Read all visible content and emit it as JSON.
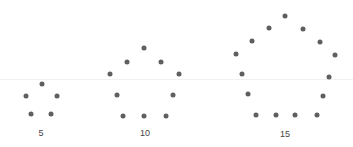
{
  "figure": {
    "title": "",
    "dot_color": "#5f5f5f",
    "groups": [
      {
        "label": "5",
        "count": 5,
        "label_pos": [
          41,
          133
        ],
        "dots": [
          [
            42,
            84
          ],
          [
            26,
            96
          ],
          [
            57,
            96
          ],
          [
            31,
            114
          ],
          [
            51,
            114
          ]
        ]
      },
      {
        "label": "10",
        "count": 10,
        "label_pos": [
          145,
          133
        ],
        "dots": [
          [
            144,
            48
          ],
          [
            127,
            62
          ],
          [
            161,
            62
          ],
          [
            110,
            74
          ],
          [
            179,
            74
          ],
          [
            117,
            95
          ],
          [
            173,
            95
          ],
          [
            123,
            116
          ],
          [
            144,
            116
          ],
          [
            166,
            116
          ]
        ]
      },
      {
        "label": "15",
        "count": 15,
        "label_pos": [
          285,
          134
        ],
        "dots": [
          [
            285,
            16
          ],
          [
            269,
            28
          ],
          [
            303,
            29
          ],
          [
            252,
            41
          ],
          [
            320,
            42
          ],
          [
            236,
            54
          ],
          [
            335,
            55
          ],
          [
            242,
            74
          ],
          [
            329,
            77
          ],
          [
            248,
            94
          ],
          [
            323,
            96
          ],
          [
            256,
            115
          ],
          [
            276,
            115
          ],
          [
            295,
            115
          ],
          [
            317,
            115
          ]
        ]
      }
    ]
  }
}
